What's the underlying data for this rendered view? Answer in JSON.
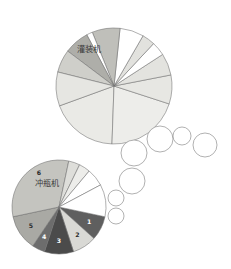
{
  "figure": {
    "background_color": "#ffffff",
    "width": 231,
    "height": 269
  },
  "chart_data": [
    {
      "type": "pie",
      "id": "filling-machine-pie",
      "title": "灌装机",
      "title_position": "inside-upper-left",
      "center": [
        114,
        86
      ],
      "radius": 58,
      "start_angle_deg": 200,
      "direction": "counterclockwise",
      "legend": "none",
      "grid": false,
      "categories": [
        "1",
        "2",
        "3",
        "4",
        "5",
        "6",
        "7",
        "8",
        "9"
      ],
      "values": [
        6.0,
        7.5,
        9.0,
        3.5,
        1.5,
        7.0,
        3.0,
        2.0,
        60.5
      ],
      "colors": [
        "#ffffff",
        "#e8e8e6",
        "#b9b9b5",
        "#ffffff",
        "#dddbd6",
        "#b0b0ab",
        "#c9c9c4",
        "#e3e3de",
        "#e9e9e5"
      ],
      "labels_shown": false
    },
    {
      "type": "pie",
      "id": "bottle-rinser-pie",
      "title": "冲瓶机",
      "title_position": "inside-upper-left",
      "center": [
        59,
        207
      ],
      "radius": 47,
      "start_angle_deg": 200,
      "direction": "counterclockwise",
      "legend": "none",
      "grid": false,
      "categories": [
        "1",
        "2",
        "3",
        "4",
        "5",
        "6"
      ],
      "values": [
        9.5,
        9.0,
        11.5,
        5.0,
        13.5,
        36.0
      ],
      "colors": [
        "#5d5d5d",
        "#d6d6d2",
        "#4a4a4a",
        "#606060",
        "#a6a6a1",
        "#c2c2bd"
      ],
      "labels_shown": true,
      "data_labels": [
        "1",
        "2",
        "3",
        "4",
        "5",
        "6"
      ],
      "extra_unlabeled_values": [
        4.0,
        5.0,
        3.5,
        3.0
      ],
      "extra_unlabeled_colors": [
        "#ffffff",
        "#ffffff",
        "#ededea",
        "#d9d9d5"
      ]
    }
  ],
  "pie_top": {
    "title": "灌装机",
    "title_x": 89,
    "title_y": 52,
    "center_x": 114,
    "center_y": 86,
    "radius": 58,
    "slices": [
      {
        "name": "slice-a",
        "start": 200,
        "sweep": 68,
        "color": "#eaeae6"
      },
      {
        "name": "slice-b",
        "start": 268,
        "sweep": 74,
        "color": "#ededea"
      },
      {
        "name": "slice-c",
        "start": 342,
        "sweep": 29,
        "color": "#e7e7e3"
      },
      {
        "name": "slice-d",
        "start": 11,
        "sweep": 22,
        "color": "#e3e3df"
      },
      {
        "name": "slice-e",
        "start": 33,
        "sweep": 14,
        "color": "#ffffff"
      },
      {
        "name": "slice-f",
        "start": 47,
        "sweep": 13,
        "color": "#e2e2de"
      },
      {
        "name": "slice-g",
        "start": 60,
        "sweep": 24,
        "color": "#ffffff"
      },
      {
        "name": "slice-h",
        "start": 84,
        "sweep": 28,
        "color": "#bfbfba"
      },
      {
        "name": "slice-i",
        "start": 112,
        "sweep": 6,
        "color": "#ffffff"
      },
      {
        "name": "slice-j",
        "start": 118,
        "sweep": 25,
        "color": "#aeaea9"
      },
      {
        "name": "slice-k",
        "start": 143,
        "sweep": 23,
        "color": "#cfcfca"
      },
      {
        "name": "slice-l",
        "start": 166,
        "sweep": 34,
        "color": "#e6e6e2"
      }
    ]
  },
  "pie_bottom": {
    "title": "冲瓶机",
    "title_x": 47,
    "title_y": 186,
    "center_x": 59,
    "center_y": 207,
    "radius": 47,
    "slices": [
      {
        "name": "slice-1",
        "start": 318,
        "sweep": 30,
        "color": "#5f5f5f",
        "label": "1",
        "label_dark": true
      },
      {
        "name": "slice-2",
        "start": 288,
        "sweep": 30,
        "color": "#d9d9d5",
        "label": "2",
        "label_dark": false
      },
      {
        "name": "slice-3",
        "start": 252,
        "sweep": 36,
        "color": "#4b4b4b",
        "label": "3",
        "label_dark": true
      },
      {
        "name": "slice-4",
        "start": 236,
        "sweep": 16,
        "color": "#6d6d6d",
        "label": "4",
        "label_dark": true
      },
      {
        "name": "slice-5",
        "start": 192,
        "sweep": 44,
        "color": "#a9a9a4",
        "label": "5",
        "label_dark": false
      },
      {
        "name": "slice-6",
        "start": 78,
        "sweep": 114,
        "color": "#c4c4bf",
        "label": "6",
        "label_dark": false
      },
      {
        "name": "slice-7",
        "start": 64,
        "sweep": 14,
        "color": "#dedeDA",
        "label": "",
        "label_dark": false
      },
      {
        "name": "slice-8",
        "start": 50,
        "sweep": 14,
        "color": "#ededea",
        "label": "",
        "label_dark": false
      },
      {
        "name": "slice-9",
        "start": 28,
        "sweep": 22,
        "color": "#ffffff",
        "label": "",
        "label_dark": false
      },
      {
        "name": "slice-10",
        "start": 348,
        "sweep": 40,
        "color": "#ffffff",
        "label": "",
        "label_dark": false
      }
    ]
  },
  "bubble_trail": {
    "description": "chain of empty outlined circles linking the two pies",
    "stroke_color": "#8f8f8f",
    "fill_color": "#ffffff",
    "circles": [
      {
        "name": "bubble-1",
        "cx": 134,
        "cy": 153,
        "r": 13
      },
      {
        "name": "bubble-2",
        "cx": 160,
        "cy": 139,
        "r": 13
      },
      {
        "name": "bubble-3",
        "cx": 182,
        "cy": 136,
        "r": 9
      },
      {
        "name": "bubble-4",
        "cx": 205,
        "cy": 145,
        "r": 12
      },
      {
        "name": "bubble-5",
        "cx": 132,
        "cy": 181,
        "r": 13
      },
      {
        "name": "bubble-6",
        "cx": 116,
        "cy": 198,
        "r": 8
      },
      {
        "name": "bubble-7",
        "cx": 116,
        "cy": 216,
        "r": 8
      }
    ]
  }
}
